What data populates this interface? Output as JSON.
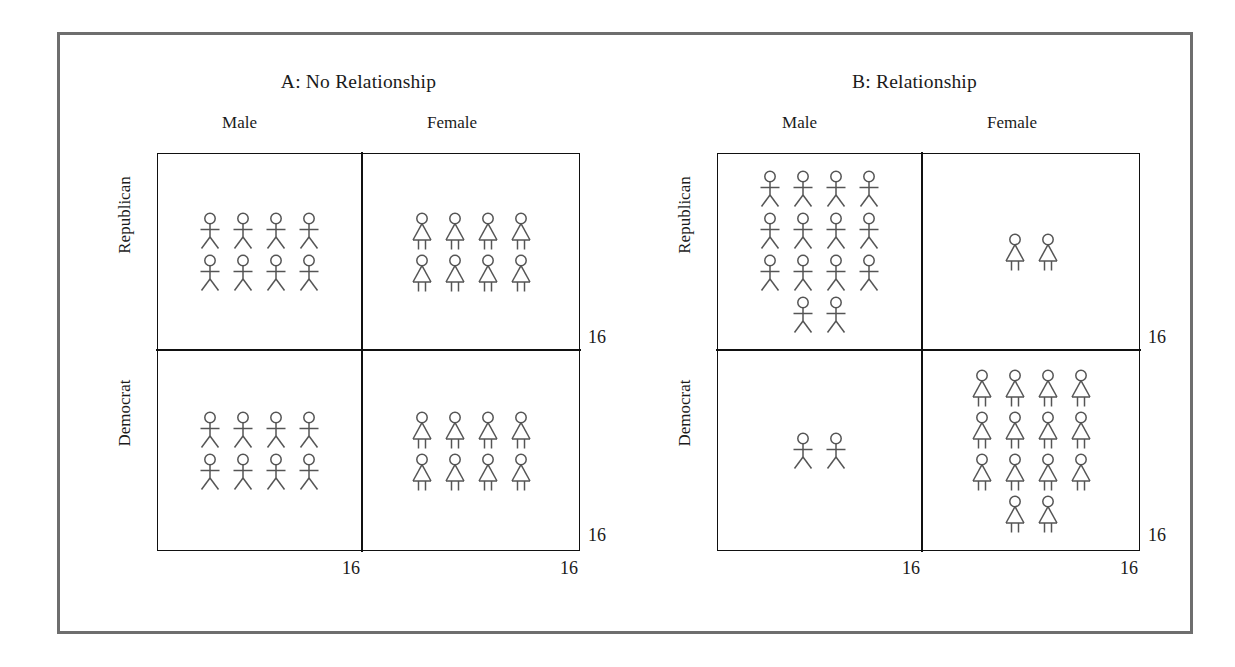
{
  "figure": {
    "frame_color": "#6e6e6e",
    "table_line_color": "#111111",
    "glyph_color": "#555555"
  },
  "panels": [
    {
      "id": "A",
      "title": "A: No Relationship",
      "column_headers": [
        "Male",
        "Female"
      ],
      "row_headers": [
        "Republican",
        "Democrat"
      ],
      "cells": [
        [
          {
            "glyph": "male-figure",
            "count": 8,
            "rows": [
              4,
              4
            ]
          },
          {
            "glyph": "female-figure",
            "count": 8,
            "rows": [
              4,
              4
            ]
          }
        ],
        [
          {
            "glyph": "male-figure",
            "count": 8,
            "rows": [
              4,
              4
            ]
          },
          {
            "glyph": "female-figure",
            "count": 8,
            "rows": [
              4,
              4
            ]
          }
        ]
      ],
      "row_totals": [
        "16",
        "16"
      ],
      "col_totals": [
        "16",
        "16"
      ]
    },
    {
      "id": "B",
      "title": "B: Relationship",
      "column_headers": [
        "Male",
        "Female"
      ],
      "row_headers": [
        "Republican",
        "Democrat"
      ],
      "cells": [
        [
          {
            "glyph": "male-figure",
            "count": 14,
            "rows": [
              4,
              4,
              4,
              2
            ]
          },
          {
            "glyph": "female-figure",
            "count": 2,
            "rows": [
              2
            ]
          }
        ],
        [
          {
            "glyph": "male-figure",
            "count": 2,
            "rows": [
              2
            ]
          },
          {
            "glyph": "female-figure",
            "count": 14,
            "rows": [
              4,
              4,
              4,
              2
            ]
          }
        ]
      ],
      "row_totals": [
        "16",
        "16"
      ],
      "col_totals": [
        "16",
        "16"
      ]
    }
  ],
  "chart_data": {
    "type": "table",
    "subplots": [
      {
        "title": "A: No Relationship",
        "row_variable": "Party",
        "col_variable": "Gender",
        "categories_rows": [
          "Republican",
          "Democrat"
        ],
        "categories_cols": [
          "Male",
          "Female"
        ],
        "values": [
          [
            8,
            8
          ],
          [
            8,
            8
          ]
        ],
        "row_totals": [
          16,
          16
        ],
        "col_totals": [
          16,
          16
        ],
        "grand_total": 32
      },
      {
        "title": "B: Relationship",
        "row_variable": "Party",
        "col_variable": "Gender",
        "categories_rows": [
          "Republican",
          "Democrat"
        ],
        "categories_cols": [
          "Male",
          "Female"
        ],
        "values": [
          [
            14,
            2
          ],
          [
            2,
            14
          ]
        ],
        "row_totals": [
          16,
          16
        ],
        "col_totals": [
          16,
          16
        ],
        "grand_total": 32
      }
    ]
  }
}
